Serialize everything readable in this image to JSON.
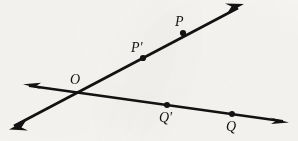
{
  "figure": {
    "background_color": "#f7f6f2",
    "ink_color": "#121212",
    "width": 298,
    "height": 141,
    "labels": {
      "origin": "O",
      "p_prime": "P'",
      "p": "P",
      "q_prime": "Q'",
      "q": "Q"
    },
    "points": [
      {
        "name": "O",
        "label": "O",
        "x": 81,
        "y": 91,
        "marker": false,
        "label_x": 70,
        "label_y": 74
      },
      {
        "name": "P'",
        "label": "P'",
        "x": 143,
        "y": 58,
        "marker": true,
        "label_x": 131,
        "label_y": 41
      },
      {
        "name": "P",
        "label": "P",
        "x": 183,
        "y": 33,
        "marker": true,
        "label_x": 174,
        "label_y": 15
      },
      {
        "name": "Q'",
        "label": "Q'",
        "x": 167,
        "y": 105,
        "marker": true,
        "label_x": 159,
        "label_y": 111
      },
      {
        "name": "Q",
        "label": "Q",
        "x": 232,
        "y": 114,
        "marker": true,
        "label_x": 226,
        "label_y": 119
      }
    ],
    "lines": [
      {
        "name": "line-OP",
        "through": [
          "O",
          "P'",
          "P"
        ],
        "x1": 10,
        "y1": 128,
        "x2": 243,
        "y2": 5,
        "arrow_start": true,
        "arrow_end": true,
        "stroke_width": 2.6
      },
      {
        "name": "line-OQ",
        "through": [
          "O",
          "Q'",
          "Q"
        ],
        "x1": 24,
        "y1": 85,
        "x2": 288,
        "y2": 122,
        "arrow_start": true,
        "arrow_end": true,
        "stroke_width": 2.6
      }
    ],
    "marker_radius": 3.0
  }
}
